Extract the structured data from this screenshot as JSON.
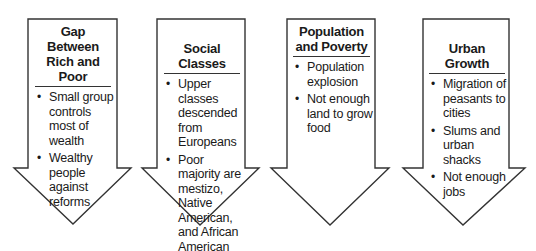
{
  "diagram": {
    "type": "flow-arrows",
    "arrows": [
      {
        "title": "Gap Between Rich and Poor",
        "bullets": [
          "Small group controls most of wealth",
          "Wealthy people against reforms"
        ]
      },
      {
        "title": "Social Classes",
        "bullets": [
          "Upper classes descended from Europeans",
          "Poor majority are mestizo, Native American, and African American"
        ]
      },
      {
        "title": "Population and Poverty",
        "bullets": [
          "Population explosion",
          "Not enough land to grow food"
        ]
      },
      {
        "title": "Urban Growth",
        "bullets": [
          "Migration of peasants to cities",
          "Slums and urban shacks",
          "Not enough jobs"
        ]
      }
    ],
    "colors": {
      "outline": "#333333",
      "fill": "#ffffff",
      "text": "#1a1a1a"
    }
  }
}
